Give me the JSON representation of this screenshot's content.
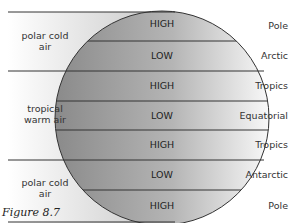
{
  "figure": {
    "caption": "Figure 8.7",
    "air_masses": [
      {
        "line1": "polar cold",
        "line2": "air"
      },
      {
        "line1": "tropical",
        "line2": "warm air"
      },
      {
        "line1": "polar cold",
        "line2": "air"
      }
    ],
    "bands": [
      "HIGH",
      "LOW",
      "HIGH",
      "LOW",
      "HIGH",
      "LOW",
      "HIGH"
    ],
    "zones": [
      "Pole",
      "Arctic",
      "Tropics",
      "Equatorial",
      "Tropics",
      "Antarctic",
      "Pole"
    ],
    "colors": {
      "sphere_dark": "#8a8a8a",
      "sphere_light": "#f4f4f4",
      "line": "#333333"
    }
  }
}
